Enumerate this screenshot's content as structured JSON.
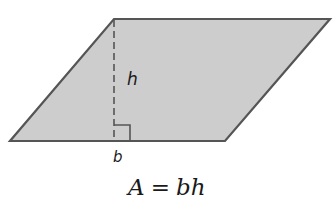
{
  "figure": {
    "shape": "parallelogram",
    "fill_color": "#cdcdcd",
    "stroke_color": "#555555",
    "height_line_style": "dashed",
    "right_angle_marker": true
  },
  "labels": {
    "height": "h",
    "base": "b"
  },
  "formula": {
    "lhs": "A",
    "equals": "=",
    "rhs": "bh"
  }
}
